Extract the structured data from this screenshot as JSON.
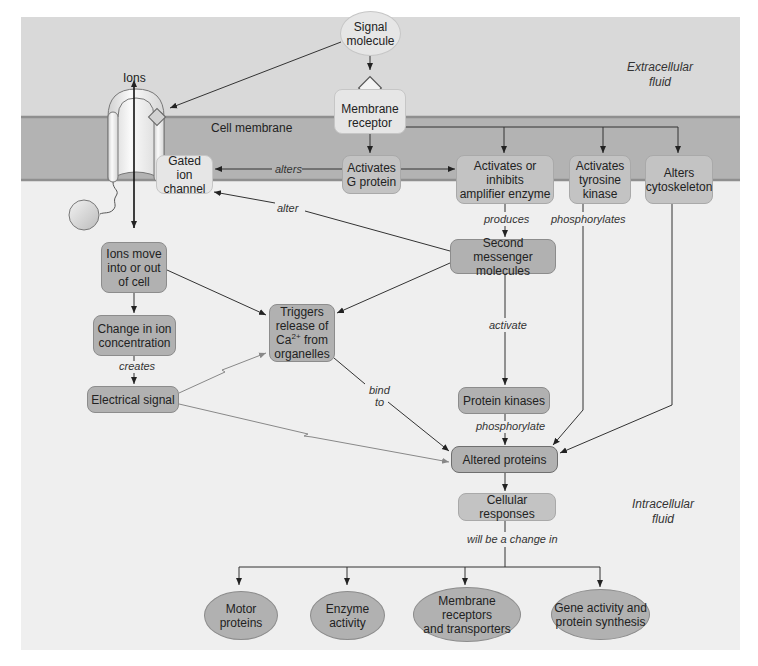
{
  "regions": {
    "extracellular": "Extracellular fluid",
    "extracellular_line1": "Extracellular",
    "extracellular_line2": "fluid",
    "intracellular_line1": "Intracellular",
    "intracellular_line2": "fluid",
    "membrane": "Cell membrane",
    "ions": "Ions"
  },
  "colors": {
    "extracellular_bg": "#d9d9d9",
    "membrane_fill": "#b3b3b3",
    "membrane_edge": "#8f8f8f",
    "intracellular_bg": "#efefef",
    "box_light": "#e6e6e6",
    "box_mid": "#c3c3c3",
    "box_dark": "#b1b1b1",
    "arrow": "#333333",
    "electrical_arrow": "#888888"
  },
  "nodes": {
    "signal_molecule": {
      "line1": "Signal",
      "line2": "molecule"
    },
    "membrane_receptor": {
      "line1": "Membrane",
      "line2": "receptor"
    },
    "gated_ion_channel": {
      "line1": "Gated ion",
      "line2": "channel"
    },
    "activates_g_protein": {
      "line1": "Activates",
      "line2": "G protein"
    },
    "amplifier_enzyme": {
      "line1": "Activates or",
      "line2": "inhibits",
      "line3": "amplifier enzyme"
    },
    "tyrosine_kinase": {
      "line1": "Activates",
      "line2": "tyrosine",
      "line3": "kinase"
    },
    "alters_cytoskeleton": {
      "line1": "Alters",
      "line2": "cytoskeleton"
    },
    "second_messenger": {
      "line1": "Second messenger",
      "line2": "molecules"
    },
    "ions_move": {
      "line1": "Ions move",
      "line2": "into or out",
      "line3": "of cell"
    },
    "change_in_ion": {
      "line1": "Change in ion",
      "line2": "concentration"
    },
    "electrical_signal": {
      "label": "Electrical signal"
    },
    "triggers_release": {
      "line1": "Triggers",
      "line2": "release of",
      "line3_prefix": "Ca",
      "line3_sup": "2+",
      "line3_suffix": " from",
      "line4": "organelles"
    },
    "protein_kinases": {
      "label": "Protein kinases"
    },
    "altered_proteins": {
      "label": "Altered proteins"
    },
    "cellular_responses": {
      "label": "Cellular responses"
    },
    "motor_proteins": {
      "line1": "Motor",
      "line2": "proteins"
    },
    "enzyme_activity": {
      "line1": "Enzyme",
      "line2": "activity"
    },
    "membrane_receptors_transporters": {
      "line1": "Membrane receptors",
      "line2": "and transporters"
    },
    "gene_activity": {
      "line1": "Gene activity and",
      "line2": "protein synthesis"
    }
  },
  "edge_labels": {
    "alters": "alters",
    "alter": "alter",
    "produces": "produces",
    "phosphorylates": "phosphorylates",
    "activate": "activate",
    "phosphorylate": "phosphorylate",
    "creates": "creates",
    "bind": "bind",
    "to": "to",
    "will_be_a_change_in": "will be a change in"
  }
}
